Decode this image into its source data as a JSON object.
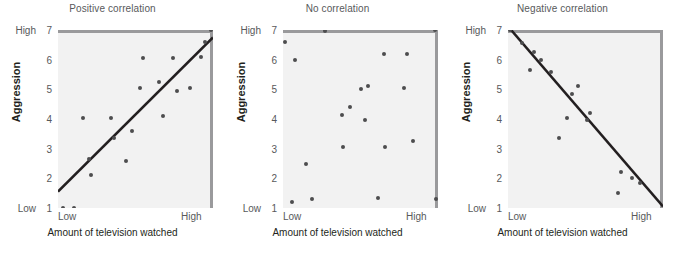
{
  "figure": {
    "background": "#ffffff",
    "plot_background": "#f2f2f2",
    "dot_color": "#4d4d4f",
    "line_color": "#231f20",
    "frame_color": "#9a9a9c"
  },
  "axis": {
    "y_title": "Aggression",
    "x_title": "Amount of television watched",
    "y_low_label": "Low",
    "y_high_label": "High",
    "x_low_label": "Low",
    "x_high_label": "High",
    "y_ticks": [
      "7",
      "6",
      "5",
      "4",
      "3",
      "2",
      "1"
    ],
    "y_range": [
      1,
      7
    ],
    "x_range": [
      0,
      100
    ]
  },
  "chart_data": [
    {
      "type": "scatter",
      "title": "Positive correlation",
      "xlabel": "Amount of television watched",
      "ylabel": "Aggression",
      "xlim": [
        0,
        100
      ],
      "ylim": [
        1,
        7
      ],
      "grid": false,
      "legend": "none",
      "x_tick_labels": [
        "Low",
        "High"
      ],
      "y_tick_labels": [
        "1",
        "2",
        "3",
        "4",
        "5",
        "6",
        "7"
      ],
      "y_axis_endpoint_labels": {
        "bottom": "Low",
        "top": "High"
      },
      "points": [
        {
          "x": 3,
          "y": 1.0
        },
        {
          "x": 10,
          "y": 1.0
        },
        {
          "x": 16,
          "y": 4.05
        },
        {
          "x": 21,
          "y": 2.1
        },
        {
          "x": 20,
          "y": 2.65
        },
        {
          "x": 34,
          "y": 4.05
        },
        {
          "x": 36,
          "y": 3.35
        },
        {
          "x": 44,
          "y": 2.6
        },
        {
          "x": 48,
          "y": 3.6
        },
        {
          "x": 53,
          "y": 5.05
        },
        {
          "x": 55,
          "y": 6.05
        },
        {
          "x": 65,
          "y": 5.25
        },
        {
          "x": 68,
          "y": 4.1
        },
        {
          "x": 74,
          "y": 6.05
        },
        {
          "x": 77,
          "y": 4.95
        },
        {
          "x": 85,
          "y": 5.05
        },
        {
          "x": 92,
          "y": 6.1
        },
        {
          "x": 95,
          "y": 6.6
        },
        {
          "x": 99,
          "y": 7.0
        }
      ],
      "trendline": {
        "x1": 0,
        "y1": 1.55,
        "x2": 100,
        "y2": 6.75
      }
    },
    {
      "type": "scatter",
      "title": "No correlation",
      "xlabel": "Amount of television watched",
      "ylabel": "Aggression",
      "xlim": [
        0,
        100
      ],
      "ylim": [
        1,
        7
      ],
      "grid": false,
      "legend": "none",
      "x_tick_labels": [
        "Low",
        "High"
      ],
      "y_tick_labels": [
        "1",
        "2",
        "3",
        "4",
        "5",
        "6",
        "7"
      ],
      "y_axis_endpoint_labels": {
        "bottom": "Low",
        "top": "High"
      },
      "points": [
        {
          "x": 1,
          "y": 6.6
        },
        {
          "x": 8,
          "y": 6.0
        },
        {
          "x": 6,
          "y": 1.2
        },
        {
          "x": 15,
          "y": 2.5
        },
        {
          "x": 19,
          "y": 1.3
        },
        {
          "x": 27,
          "y": 6.95
        },
        {
          "x": 38,
          "y": 4.15
        },
        {
          "x": 43,
          "y": 4.4
        },
        {
          "x": 39,
          "y": 3.05
        },
        {
          "x": 50,
          "y": 5.0
        },
        {
          "x": 55,
          "y": 5.1
        },
        {
          "x": 53,
          "y": 3.95
        },
        {
          "x": 61,
          "y": 1.35
        },
        {
          "x": 65,
          "y": 6.2
        },
        {
          "x": 66,
          "y": 3.05
        },
        {
          "x": 78,
          "y": 5.05
        },
        {
          "x": 80,
          "y": 6.2
        },
        {
          "x": 84,
          "y": 3.25
        },
        {
          "x": 98,
          "y": 7.0
        },
        {
          "x": 99,
          "y": 1.3
        }
      ],
      "trendline": null
    },
    {
      "type": "scatter",
      "title": "Negative correlation",
      "xlabel": "Amount of television watched",
      "ylabel": "Aggression",
      "xlim": [
        0,
        100
      ],
      "ylim": [
        1,
        7
      ],
      "grid": false,
      "legend": "none",
      "x_tick_labels": [
        "Low",
        "High"
      ],
      "y_tick_labels": [
        "1",
        "2",
        "3",
        "4",
        "5",
        "6",
        "7"
      ],
      "y_axis_endpoint_labels": {
        "bottom": "Low",
        "top": "High"
      },
      "points": [
        {
          "x": 1,
          "y": 7.0
        },
        {
          "x": 9,
          "y": 6.55
        },
        {
          "x": 17,
          "y": 6.25
        },
        {
          "x": 21,
          "y": 6.0
        },
        {
          "x": 14,
          "y": 5.65
        },
        {
          "x": 28,
          "y": 5.6
        },
        {
          "x": 41,
          "y": 4.85
        },
        {
          "x": 45,
          "y": 5.1
        },
        {
          "x": 38,
          "y": 4.05
        },
        {
          "x": 53,
          "y": 4.2
        },
        {
          "x": 51,
          "y": 3.95
        },
        {
          "x": 33,
          "y": 3.35
        },
        {
          "x": 73,
          "y": 2.2
        },
        {
          "x": 80,
          "y": 2.0
        },
        {
          "x": 85,
          "y": 1.85
        },
        {
          "x": 71,
          "y": 1.5
        }
      ],
      "trendline": {
        "x1": 2,
        "y1": 7.0,
        "x2": 100,
        "y2": 1.05
      }
    }
  ]
}
